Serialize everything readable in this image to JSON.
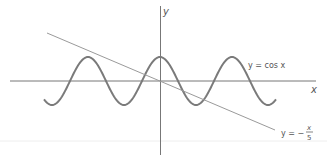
{
  "chart_data": {
    "type": "line",
    "title": "",
    "xlabel": "x",
    "ylabel": "y",
    "grid": false,
    "series": [
      {
        "name": "y = cos x",
        "function": "cos(x)",
        "x_range": [
          -10.2,
          10.1
        ]
      },
      {
        "name": "y = -x/5",
        "function": "-x/5",
        "x_range": [
          -10,
          10
        ]
      }
    ],
    "annotations": [
      "y = cos x",
      "y = -x/5"
    ]
  },
  "labels": {
    "y_axis": "y",
    "x_axis": "x",
    "cos_label": "y = cos x",
    "line_label_prefix": "y = −",
    "line_label_num": "x",
    "line_label_den": "5"
  },
  "colors": {
    "axis": "#666666",
    "curve": "#777777",
    "line": "#999999",
    "separator": "#eeeeee"
  }
}
